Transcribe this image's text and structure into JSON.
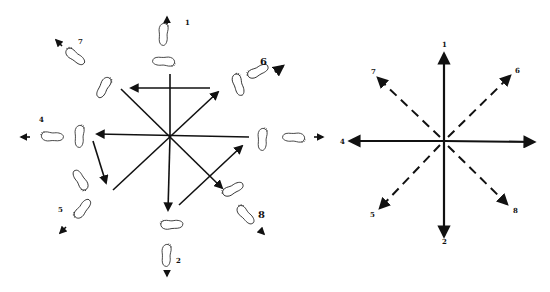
{
  "figure": {
    "left_panel": {
      "title": "footstep-direction-diagram",
      "labels": {
        "d1": "1",
        "d2": "2",
        "d4": "4",
        "d5": "5",
        "d6": "6",
        "d7": "7",
        "d8": "8"
      }
    },
    "right_panel": {
      "title": "compass-direction-diagram",
      "labels": {
        "d1": "1",
        "d2": "2",
        "d4": "4",
        "d5": "5",
        "d6": "6",
        "d7": "7",
        "d8": "8"
      },
      "solid_directions": [
        "1",
        "2",
        "4",
        "3-right"
      ],
      "dashed_directions": [
        "5",
        "6",
        "7",
        "8"
      ]
    },
    "colors": {
      "ink": "#111111",
      "background": "#ffffff"
    }
  }
}
